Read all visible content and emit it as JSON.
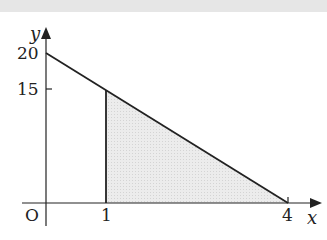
{
  "diagram": {
    "type": "function-graph-shaded-region",
    "axes": {
      "x_label": "x",
      "y_label": "y",
      "origin_label": "O"
    },
    "y_ticks": [
      {
        "value": 20,
        "label": "20"
      },
      {
        "value": 15,
        "label": "15"
      }
    ],
    "x_ticks": [
      {
        "value": 1,
        "label": "1"
      },
      {
        "value": 4,
        "label": "4"
      }
    ],
    "line": {
      "from": [
        0,
        20
      ],
      "to": [
        4,
        0
      ],
      "equation": "y = 20 - 5x"
    },
    "shaded_region": {
      "vertices": [
        [
          1,
          0
        ],
        [
          1,
          15
        ],
        [
          4,
          0
        ]
      ],
      "fill": "#e9e9e9"
    },
    "colors": {
      "stroke": "#222222",
      "shade": "#e9e9e9",
      "top_band": "#e6e6e6"
    }
  }
}
